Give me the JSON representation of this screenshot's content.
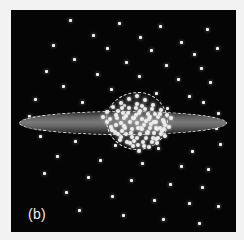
{
  "figure": {
    "label": "(b)",
    "caption_letter": "b",
    "diagram_type": "edge-on galaxy structure schematic",
    "background_color": "#050505",
    "frame_color": "#f2f2f2"
  },
  "components": {
    "disk": {
      "name": "galactic disk",
      "shape": "thin lens / flattened ellipse",
      "fill_color": "#6f6f6f",
      "outline_style": "dashed",
      "outline_color": "#e8e8e8",
      "center_x": 112,
      "center_y": 113,
      "semi_major_px": 104,
      "semi_minor_px": 12
    },
    "bulge": {
      "name": "central bulge",
      "shape": "rounded blob",
      "outline_style": "dashed",
      "outline_color": "#e6e6e6",
      "center_x": 126,
      "center_y": 111,
      "width_px": 62,
      "height_px": 58,
      "star_color": "#efefef",
      "star_count": 96
    },
    "halo": {
      "name": "halo globular clusters",
      "star_color": "#f4f4f4",
      "star_count": 58,
      "distribution": "sparse spherical"
    }
  },
  "chart_data": {
    "type": "scatter",
    "title": "",
    "xlabel": "",
    "ylabel": "",
    "xlim": [
      0,
      225
    ],
    "ylim": [
      0,
      222
    ],
    "grid": false,
    "legend": null,
    "annotations": [
      "(b)"
    ],
    "series": [
      {
        "name": "halo",
        "marker_color": "#f4f4f4",
        "marker_size": 3,
        "points": [
          [
            59,
            10
          ],
          [
            108,
            13
          ],
          [
            149,
            16
          ],
          [
            196,
            19
          ],
          [
            82,
            25
          ],
          [
            129,
            27
          ],
          [
            170,
            32
          ],
          [
            42,
            35
          ],
          [
            96,
            38
          ],
          [
            140,
            40
          ],
          [
            183,
            44
          ],
          [
            206,
            38
          ],
          [
            63,
            49
          ],
          [
            115,
            52
          ],
          [
            155,
            55
          ],
          [
            190,
            58
          ],
          [
            35,
            61
          ],
          [
            86,
            64
          ],
          [
            128,
            66
          ],
          [
            167,
            69
          ],
          [
            199,
            72
          ],
          [
            52,
            76
          ],
          [
            100,
            79
          ],
          [
            145,
            83
          ],
          [
            178,
            86
          ],
          [
            24,
            89
          ],
          [
            71,
            92
          ],
          [
            113,
            95
          ],
          [
            156,
            98
          ],
          [
            192,
            92
          ],
          [
            207,
            103
          ],
          [
            18,
            106
          ],
          [
            205,
            118
          ],
          [
            29,
            126
          ],
          [
            64,
            131
          ],
          [
            104,
            135
          ],
          [
            147,
            138
          ],
          [
            181,
            141
          ],
          [
            209,
            134
          ],
          [
            46,
            146
          ],
          [
            89,
            150
          ],
          [
            131,
            153
          ],
          [
            170,
            156
          ],
          [
            197,
            159
          ],
          [
            33,
            163
          ],
          [
            77,
            167
          ],
          [
            120,
            170
          ],
          [
            159,
            174
          ],
          [
            191,
            177
          ],
          [
            55,
            182
          ],
          [
            101,
            186
          ],
          [
            143,
            190
          ],
          [
            178,
            193
          ],
          [
            207,
            196
          ],
          [
            68,
            200
          ],
          [
            112,
            205
          ],
          [
            152,
            209
          ],
          [
            188,
            213
          ]
        ]
      },
      {
        "name": "bulge",
        "marker_color": "#efefef",
        "marker_size": 4,
        "points": [
          [
            126,
            86
          ],
          [
            118,
            89
          ],
          [
            134,
            90
          ],
          [
            110,
            93
          ],
          [
            126,
            94
          ],
          [
            142,
            95
          ],
          [
            102,
            97
          ],
          [
            118,
            98
          ],
          [
            134,
            99
          ],
          [
            150,
            100
          ],
          [
            96,
            102
          ],
          [
            112,
            103
          ],
          [
            128,
            103
          ],
          [
            144,
            104
          ],
          [
            156,
            105
          ],
          [
            92,
            107
          ],
          [
            106,
            108
          ],
          [
            122,
            108
          ],
          [
            138,
            109
          ],
          [
            152,
            110
          ],
          [
            160,
            108
          ],
          [
            96,
            112
          ],
          [
            110,
            113
          ],
          [
            126,
            113
          ],
          [
            140,
            114
          ],
          [
            154,
            115
          ],
          [
            100,
            117
          ],
          [
            114,
            118
          ],
          [
            130,
            118
          ],
          [
            146,
            119
          ],
          [
            158,
            117
          ],
          [
            104,
            122
          ],
          [
            120,
            123
          ],
          [
            136,
            123
          ],
          [
            150,
            124
          ],
          [
            110,
            127
          ],
          [
            126,
            128
          ],
          [
            142,
            128
          ],
          [
            154,
            126
          ],
          [
            116,
            132
          ],
          [
            132,
            132
          ],
          [
            146,
            133
          ],
          [
            122,
            136
          ],
          [
            138,
            137
          ],
          [
            128,
            141
          ],
          [
            113,
            108
          ],
          [
            131,
            96
          ],
          [
            145,
            112
          ],
          [
            107,
            101
          ],
          [
            121,
            119
          ],
          [
            137,
            104
          ],
          [
            149,
            118
          ],
          [
            99,
            109
          ],
          [
            115,
            124
          ],
          [
            133,
            115
          ],
          [
            143,
            123
          ],
          [
            105,
            115
          ],
          [
            125,
            105
          ],
          [
            141,
            99
          ],
          [
            153,
            112
          ],
          [
            111,
            98
          ],
          [
            129,
            124
          ],
          [
            119,
            112
          ],
          [
            135,
            128
          ],
          [
            147,
            107
          ],
          [
            101,
            120
          ],
          [
            117,
            103
          ],
          [
            131,
            109
          ],
          [
            145,
            129
          ],
          [
            123,
            131
          ],
          [
            139,
            118
          ],
          [
            109,
            130
          ],
          [
            127,
            118
          ],
          [
            143,
            112
          ],
          [
            113,
            116
          ],
          [
            129,
            101
          ],
          [
            151,
            121
          ],
          [
            121,
            127
          ],
          [
            137,
            122
          ],
          [
            105,
            105
          ],
          [
            133,
            136
          ],
          [
            119,
            133
          ],
          [
            147,
            128
          ],
          [
            125,
            98
          ],
          [
            141,
            132
          ],
          [
            115,
            106
          ],
          [
            131,
            119
          ],
          [
            149,
            104
          ],
          [
            107,
            124
          ],
          [
            123,
            108
          ],
          [
            139,
            107
          ],
          [
            153,
            119
          ],
          [
            111,
            121
          ],
          [
            135,
            111
          ],
          [
            145,
            118
          ],
          [
            127,
            135
          ]
        ]
      }
    ]
  }
}
